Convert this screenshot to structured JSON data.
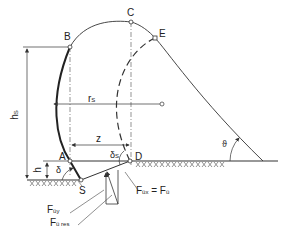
{
  "diagram": {
    "type": "technical-drawing",
    "points": {
      "A": "A",
      "B": "B",
      "C": "C",
      "D": "D",
      "E": "E",
      "S": "S"
    },
    "dimensions": {
      "hs": "h",
      "hs_sub": "S",
      "rs": "r",
      "rs_sub": "S",
      "z": "z",
      "h": "h"
    },
    "angles": {
      "delta": "δ",
      "delta_s": "δ",
      "delta_s_sub": "S",
      "theta": "ϑ"
    },
    "forces": {
      "fuy": "F",
      "fuy_sub": "üy",
      "fures": "F",
      "fures_sub": "ü res",
      "fux_eq": "F",
      "fux_sub": "üx",
      "fux_eq_sign": " = F",
      "fu_sub": "ü"
    },
    "colors": {
      "line": "#333333",
      "background": "#ffffff"
    }
  }
}
